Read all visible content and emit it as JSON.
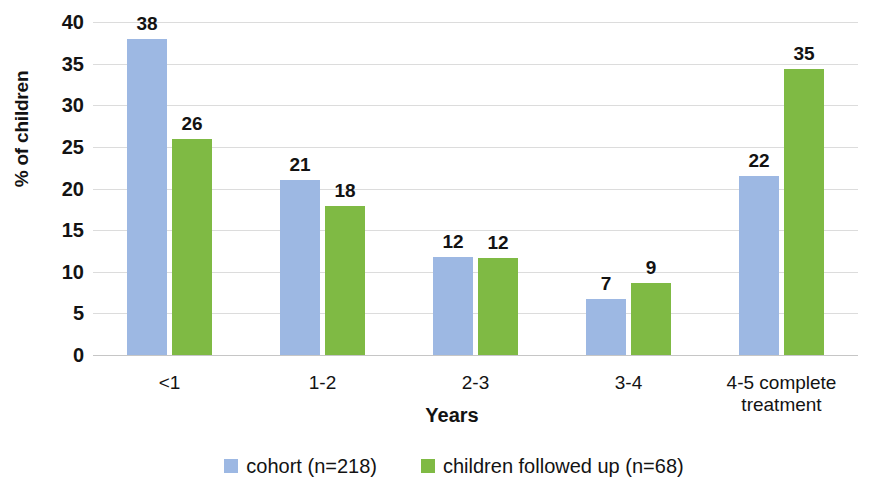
{
  "chart_data": {
    "type": "bar",
    "title": "",
    "xlabel": "Years",
    "ylabel": "% of children",
    "categories": [
      "<1",
      "1-2",
      "2-3",
      "3-4",
      "4-5 complete treatment"
    ],
    "series": [
      {
        "name": "cohort (n=218)",
        "color": "#9db8e3",
        "values": [
          38,
          21,
          12,
          7,
          22
        ],
        "plotted": [
          38,
          21,
          11.8,
          6.7,
          21.5
        ]
      },
      {
        "name": "children followed up (n=68)",
        "color": "#7fba44",
        "values": [
          26,
          18,
          12,
          9,
          35
        ],
        "plotted": [
          26,
          17.9,
          11.7,
          8.7,
          34.4
        ]
      }
    ],
    "ylim": [
      0,
      40
    ],
    "yticks": [
      0,
      5,
      10,
      15,
      20,
      25,
      30,
      35,
      40
    ],
    "ytick_labels": [
      "0",
      "5",
      "10",
      "15",
      "20",
      "25",
      "30",
      "35",
      "40"
    ],
    "grid": true,
    "legend_position": "bottom",
    "data_labels": true
  },
  "legend": {
    "items": [
      {
        "label": "cohort (n=218)",
        "color": "#9db8e3"
      },
      {
        "label": "children followed up (n=68)",
        "color": "#7fba44"
      }
    ]
  },
  "axis": {
    "y_title": "% of children",
    "x_title": "Years"
  },
  "categories_display": [
    {
      "line1": "<1",
      "line2": ""
    },
    {
      "line1": "1-2",
      "line2": ""
    },
    {
      "line1": "2-3",
      "line2": ""
    },
    {
      "line1": "3-4",
      "line2": ""
    },
    {
      "line1": "4-5 complete",
      "line2": "treatment"
    }
  ],
  "colors": {
    "series_a": "#9db8e3",
    "series_b": "#7fba44",
    "gridline": "#dcdcdc",
    "text": "#131313",
    "background": "#ffffff"
  }
}
